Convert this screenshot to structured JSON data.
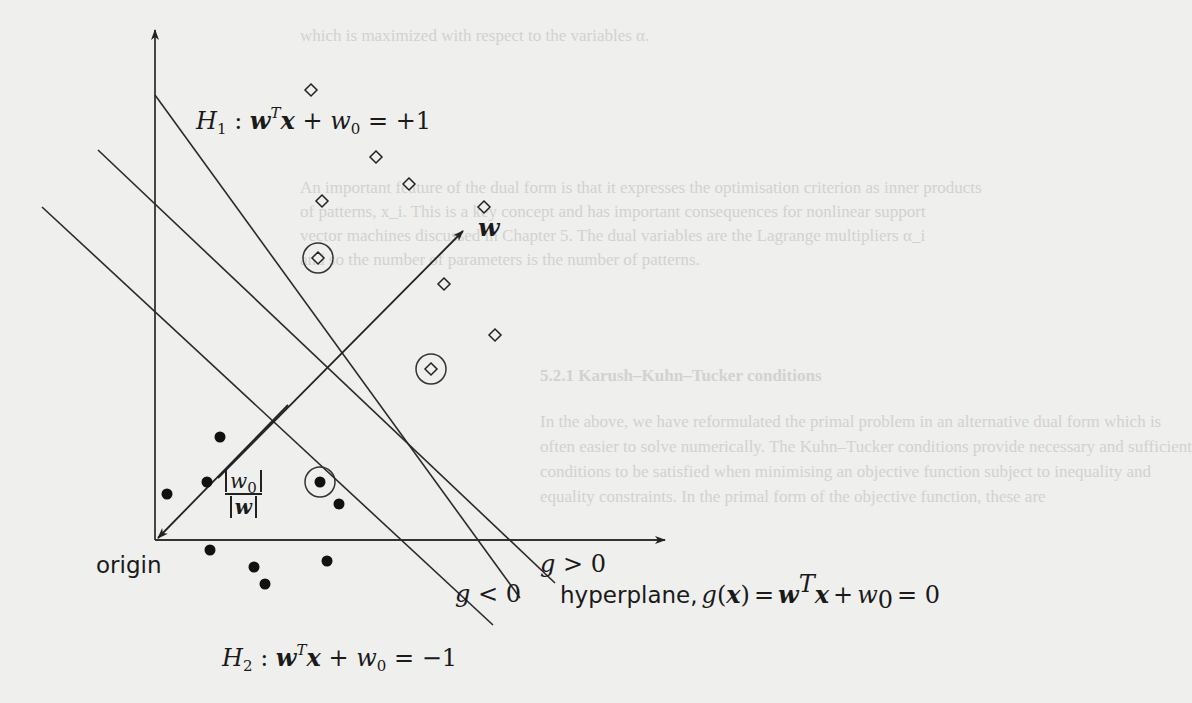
{
  "figure": {
    "type": "diagram",
    "labels": {
      "h1_name": "H",
      "h1_sub": "1",
      "h1_eq_colon": ":",
      "h1_w": "w",
      "h1_T": "T",
      "h1_x": "x",
      "h1_plus": "+",
      "h1_w0": "w",
      "h1_0": "0",
      "h1_rhs": "= +1",
      "h2_name": "H",
      "h2_sub": "2",
      "h2_eq_colon": ":",
      "h2_w": "w",
      "h2_T": "T",
      "h2_x": "x",
      "h2_plus": "+",
      "h2_w0": "w",
      "h2_0": "0",
      "h2_rhs": "= −1",
      "hyperplane_text": "hyperplane,",
      "hyperplane_g": "g",
      "hyperplane_paren_open": "(",
      "hyperplane_x": "x",
      "hyperplane_paren_close": ")",
      "hyperplane_eq": "=",
      "hyperplane_w": "w",
      "hyperplane_T": "T",
      "hyperplane_x2": "x",
      "hyperplane_plus": "+",
      "hyperplane_w0": "w",
      "hyperplane_0": "0",
      "hyperplane_rhs": "= 0",
      "g_pos_g": "g",
      "g_pos_rel": "> 0",
      "g_neg_g": "g",
      "g_neg_rel": "< 0",
      "w_vector": "w",
      "origin": "origin",
      "distance_num_w": "w",
      "distance_num_0": "0",
      "distance_den": "w"
    },
    "axes": {
      "origin_px": [
        155,
        540
      ],
      "y_axis_top_px": [
        155,
        30
      ],
      "x_axis_right_px": [
        665,
        540
      ]
    },
    "lines": [
      {
        "name": "H1",
        "from": [
          155,
          95
        ],
        "to": [
          520,
          598
        ]
      },
      {
        "name": "hyperplane",
        "from": [
          98,
          150
        ],
        "to": [
          555,
          583
        ]
      },
      {
        "name": "H2",
        "from": [
          42,
          207
        ],
        "to": [
          493,
          625
        ]
      }
    ],
    "w_arrow": {
      "from": [
        218,
        478
      ],
      "to": [
        463,
        231
      ]
    },
    "distance_arrow": {
      "from": [
        288,
        405
      ],
      "to": [
        158,
        538
      ]
    },
    "class_plus_points": [
      [
        311,
        90
      ],
      [
        376,
        157
      ],
      [
        409,
        184
      ],
      [
        322,
        201
      ],
      [
        484,
        207
      ],
      [
        444,
        284
      ],
      [
        495,
        335
      ],
      [
        318,
        258
      ],
      [
        431,
        369
      ]
    ],
    "class_minus_points": [
      [
        220,
        437
      ],
      [
        207,
        482
      ],
      [
        167,
        494
      ],
      [
        339,
        504
      ],
      [
        210,
        550
      ],
      [
        254,
        567
      ],
      [
        265,
        584
      ],
      [
        327,
        561
      ],
      [
        320,
        482
      ]
    ],
    "support_vectors": [
      {
        "class": "plus",
        "at": [
          318,
          258
        ]
      },
      {
        "class": "plus",
        "at": [
          431,
          369
        ]
      },
      {
        "class": "minus",
        "at": [
          320,
          482
        ]
      }
    ]
  },
  "background_text": {
    "line1": "which is maximized with respect to the variables α.",
    "line2": "An important feature of the dual form is that it expresses the optimisation criterion as inner products",
    "line3": "of patterns, x_i. This is a key concept and has important consequences for nonlinear support",
    "line4": "vector machines discussed in Chapter 5. The dual variables are the Lagrange multipliers α_i",
    "line5": "and so the number of parameters is the number of patterns.",
    "heading": "5.2.1  Karush–Kuhn–Tucker conditions",
    "line6": "In the above, we have reformulated the primal problem in an alternative dual form which is",
    "line7": "often easier to solve numerically. The Kuhn–Tucker conditions provide necessary and sufficient",
    "line8": "conditions to be satisfied when minimising an objective function subject to inequality and",
    "line9": "equality constraints. In the primal form of the objective function, these are"
  }
}
